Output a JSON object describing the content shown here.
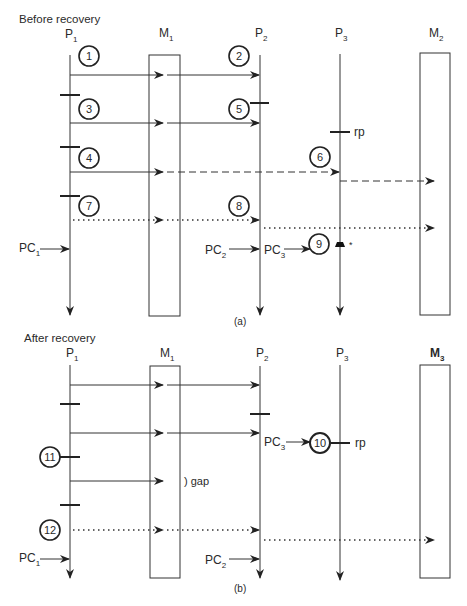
{
  "panel_a": {
    "title": "Before recovery",
    "caption": "(a)",
    "processes": [
      {
        "name": "P",
        "sub": "1"
      },
      {
        "name": "M",
        "sub": "1"
      },
      {
        "name": "P",
        "sub": "2"
      },
      {
        "name": "P",
        "sub": "3"
      },
      {
        "name": "M",
        "sub": "2"
      }
    ],
    "events": [
      "1",
      "2",
      "3",
      "4",
      "5",
      "6",
      "7",
      "8",
      "9"
    ],
    "pc1": {
      "name": "PC",
      "sub": "1"
    },
    "pc2": {
      "name": "PC",
      "sub": "2"
    },
    "pc3": {
      "name": "PC",
      "sub": "3"
    },
    "rp_label": "rp",
    "failure_mark": "*"
  },
  "panel_b": {
    "title": "After recovery",
    "caption": "(b)",
    "processes": [
      {
        "name": "P",
        "sub": "1"
      },
      {
        "name": "M",
        "sub": "1"
      },
      {
        "name": "P",
        "sub": "2"
      },
      {
        "name": "P",
        "sub": "3"
      },
      {
        "name": "M",
        "sub": "3"
      }
    ],
    "events": [
      "10",
      "11",
      "12"
    ],
    "pc1": {
      "name": "PC",
      "sub": "1"
    },
    "pc2": {
      "name": "PC",
      "sub": "2"
    },
    "pc3": {
      "name": "PC",
      "sub": "3"
    },
    "rp_label": "rp",
    "gap_label": "gap"
  },
  "colors": {
    "ink": "#2a2a2a",
    "background": "#ffffff"
  }
}
